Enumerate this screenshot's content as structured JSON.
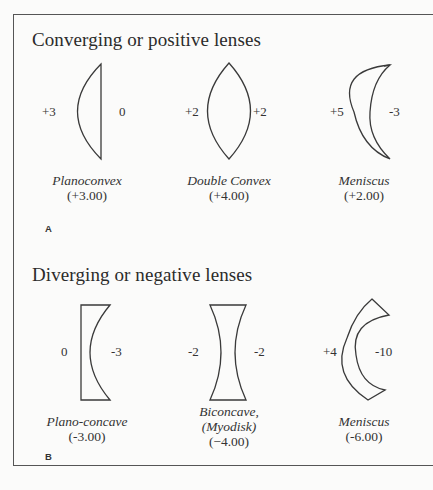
{
  "sections": [
    {
      "id": "A",
      "title": "Converging or positive lenses",
      "panel_letter": "A",
      "lenses": [
        {
          "name": "Planoconvex",
          "value": "(+3.00)",
          "left_power": "+3",
          "right_power": "0",
          "shape": "planoconvex-lens-icon"
        },
        {
          "name": "Double Convex",
          "value": "(+4.00)",
          "left_power": "+2",
          "right_power": "+2",
          "shape": "double-convex-lens-icon"
        },
        {
          "name": "Meniscus",
          "value": "(+2.00)",
          "left_power": "+5",
          "right_power": "-3",
          "shape": "positive-meniscus-lens-icon"
        }
      ]
    },
    {
      "id": "B",
      "title": "Diverging or negative lenses",
      "panel_letter": "B",
      "lenses": [
        {
          "name": "Plano-concave",
          "value": "(-3.00)",
          "left_power": "0",
          "right_power": "-3",
          "shape": "plano-concave-lens-icon"
        },
        {
          "name": "Biconcave,",
          "name_line2": "(Myodisk)",
          "value": "(−4.00)",
          "left_power": "-2",
          "right_power": "-2",
          "shape": "biconcave-lens-icon"
        },
        {
          "name": "Meniscus",
          "value": "(-6.00)",
          "left_power": "+4",
          "right_power": "-10",
          "shape": "negative-meniscus-lens-icon"
        }
      ]
    }
  ],
  "colors": {
    "background": "#fbfbfa",
    "line": "#3a3a3a",
    "text": "#2b2b2b"
  }
}
